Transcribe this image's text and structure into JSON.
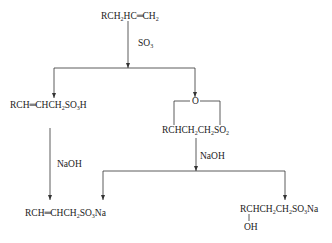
{
  "compounds": {
    "start": "RCH2HC=CH2",
    "left_acid": "RCH=CHCH2SO3H",
    "sultone_oxygen": "O",
    "sultone": "RCHCH2CH2SO2",
    "left_product": "RCH=CHCH2SO3Na",
    "right_product": "RCHCH2CH2SO3Na",
    "right_product_substituent": "OH"
  },
  "reagents": {
    "step1": "SO3",
    "left_step": "NaOH",
    "right_step": "NaOH"
  }
}
